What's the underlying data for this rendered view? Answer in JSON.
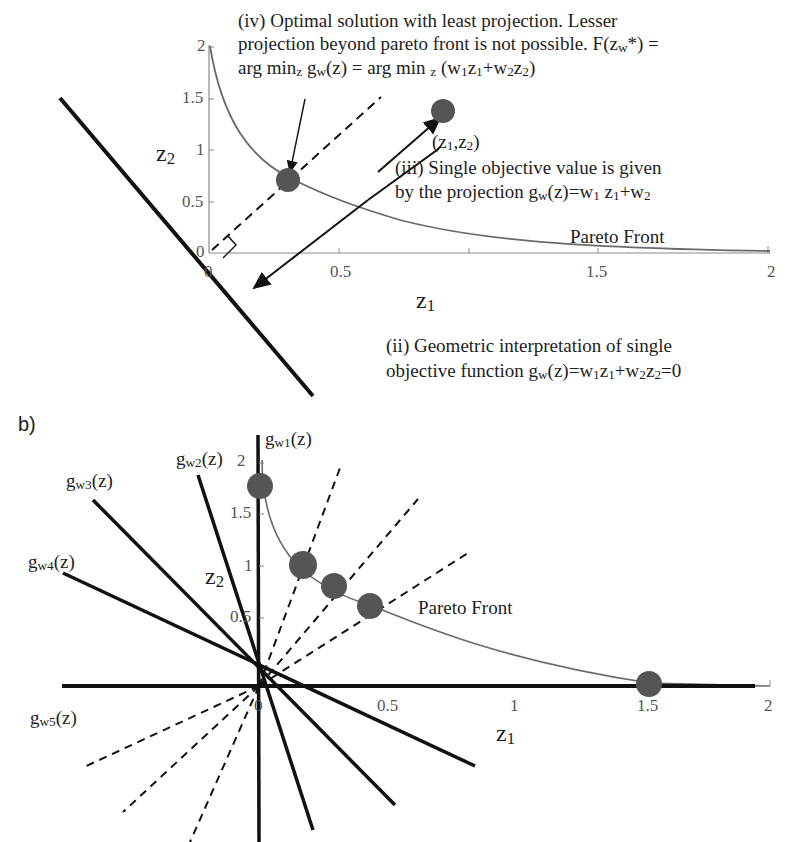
{
  "panel_a": {
    "axes": {
      "x_title": "z",
      "x_title_sub": "1",
      "y_title": "z",
      "y_title_sub": "2",
      "x_ticks": [
        "0",
        "0.5",
        "1",
        "1.5",
        "2"
      ],
      "y_ticks": [
        "0",
        "0.5",
        "1",
        "1.5",
        "2"
      ]
    },
    "curve_label": "Pareto Front",
    "point_label": "(z1,z2)",
    "annotation_iv": {
      "line1": "(iv) Optimal solution with least projection. Lesser",
      "line2": "projection beyond pareto front is not possible. F(zw*) =",
      "line3": "arg minz gw(z) = arg min z (w1z1+w2z2)"
    },
    "annotation_iii": {
      "line1": "(iii) Single objective value is given",
      "line2": "by the projection gw(z)=w1 z1+w2"
    },
    "annotation_ii": {
      "line1": "(ii) Geometric interpretation of single",
      "line2": "objective function gw(z)=w1z1+w2z2=0"
    }
  },
  "panel_b": {
    "panel_label": "b)",
    "axes": {
      "x_title": "z",
      "x_title_sub": "1",
      "y_title": "z",
      "y_title_sub": "2",
      "x_ticks": [
        "0",
        "0.5",
        "1",
        "1.5",
        "2"
      ],
      "y_ticks": [
        "0.5",
        "1",
        "1.5",
        "2"
      ]
    },
    "curve_label": "Pareto Front",
    "weight_lines": [
      {
        "label": "gw1(z)",
        "base": "g",
        "sub": "w1"
      },
      {
        "label": "gw2(z)",
        "base": "g",
        "sub": "w2"
      },
      {
        "label": "gw3(z)",
        "base": "g",
        "sub": "w3"
      },
      {
        "label": "gw4(z)",
        "base": "g",
        "sub": "w4"
      },
      {
        "label": "gw5(z)",
        "base": "g",
        "sub": "w5"
      }
    ]
  },
  "colors": {
    "line": "#111111",
    "curve": "#6a6a6a",
    "point": "#555555",
    "axis": "#8a8a8a"
  }
}
